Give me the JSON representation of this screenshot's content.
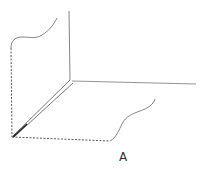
{
  "diagram": {
    "label": "A",
    "colors": {
      "solid_line": "#555555",
      "dashed_line": "#444444",
      "label": "#333333",
      "background": "#ffffff"
    },
    "elements": [
      "vertical-plane-edge",
      "horizontal-plane-edge",
      "diagonal-double-line",
      "top-left-curve",
      "right-floor-curve",
      "dashed-left-edge",
      "dashed-bottom-edge"
    ]
  }
}
